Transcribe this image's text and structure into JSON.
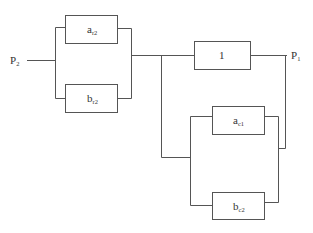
{
  "diagram": {
    "type": "reliability-block-diagram",
    "input_label": "P",
    "input_sub": "2",
    "output_label": "P",
    "output_sub": "1",
    "blocks": [
      {
        "id": "ar2",
        "main": "a",
        "sub": "r2"
      },
      {
        "id": "br2",
        "main": "b",
        "sub": "r2"
      },
      {
        "id": "one",
        "main": "1",
        "sub": ""
      },
      {
        "id": "ac1",
        "main": "a",
        "sub": "c1"
      },
      {
        "id": "bc2",
        "main": "b",
        "sub": "c2"
      }
    ],
    "line_color": "#555555",
    "background": "#ffffff"
  }
}
